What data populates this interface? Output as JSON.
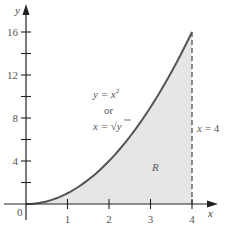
{
  "chart_data": {
    "type": "area",
    "title": "",
    "xlabel": "x",
    "ylabel": "y",
    "xlim": [
      0,
      4.5
    ],
    "ylim": [
      0,
      17.5
    ],
    "x_ticks": [
      1,
      2,
      3,
      4
    ],
    "x_tick_labels": [
      "1",
      "2",
      "3",
      "4"
    ],
    "y_ticks": [
      2,
      4,
      6,
      8,
      10,
      12,
      14,
      16
    ],
    "y_tick_labels": [
      "4",
      "8",
      "12",
      "16"
    ],
    "labeled_y_ticks": [
      4,
      8,
      12,
      16
    ],
    "origin_label": "0",
    "grid": false,
    "series": [
      {
        "name": "y = x^2",
        "x": [
          0,
          0.5,
          1,
          1.5,
          2,
          2.5,
          3,
          3.5,
          4
        ],
        "values": [
          0,
          0.25,
          1,
          2.25,
          4,
          6.25,
          9,
          12.25,
          16
        ]
      }
    ],
    "shaded_region": {
      "label": "R",
      "description": "area under y = x^2 from x = 0 to x = 4",
      "x_from": 0,
      "x_to": 4
    },
    "vertical_line": {
      "x": 4,
      "style": "dashed",
      "label": "x = 4"
    },
    "annotations": {
      "curve_eq_line1_lhs": "y = x",
      "curve_eq_line1_exp": "2",
      "curve_eq_or": "or",
      "curve_eq_line2_lhs": "x = ",
      "curve_eq_line2_sqrt": "√",
      "curve_eq_line2_arg": "y",
      "boundary_label_lhs": "x",
      "boundary_label_rhs": "= 4",
      "region_label": "R"
    },
    "colors": {
      "curve": "#555555",
      "fill": "#e6e6e6",
      "axis": "#222222",
      "dashed_line": "#444444"
    }
  }
}
